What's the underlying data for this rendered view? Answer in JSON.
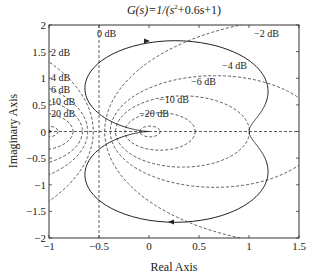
{
  "chart_data": {
    "type": "line",
    "title_parts": {
      "pre": "G(s)=1/(s",
      "sup": "2",
      "post": "+0.6s+1)"
    },
    "xlabel": "Real Axis",
    "ylabel": "Imaginary Axis",
    "xlim": [
      -1,
      1.5
    ],
    "ylim": [
      -2,
      2
    ],
    "xticks": [
      -1,
      -0.5,
      0,
      0.5,
      1,
      1.5
    ],
    "xtick_labels": [
      "−1",
      "−0.5",
      "0",
      "0.5",
      "1",
      "1.5"
    ],
    "yticks": [
      -2,
      -1.5,
      -1,
      -0.5,
      0,
      0.5,
      1,
      1.5,
      2
    ],
    "ytick_labels": [
      "−2",
      "−1.5",
      "−1",
      "−0.5",
      "0",
      "0.5",
      "1",
      "1.5",
      "2"
    ],
    "grid": "M-circles",
    "transfer_function": {
      "num": [
        1
      ],
      "den": [
        1,
        0.6,
        1
      ]
    },
    "series": [
      {
        "name": "Nyquist plot",
        "style": "solid",
        "description": "closed contour from (1,0) through (0,-1.667) back to origin and mirrored positive-frequency branch"
      }
    ],
    "m_circles": [
      {
        "label": "0 dB",
        "db": 0,
        "label_pos": [
          -0.52,
          1.78
        ]
      },
      {
        "label": "2 dB",
        "db": 2,
        "label_pos": [
          -0.98,
          1.42
        ]
      },
      {
        "label": "−2 dB",
        "db": -2,
        "label_pos": [
          1.05,
          1.78
        ]
      },
      {
        "label": "4 dB",
        "db": 4,
        "label_pos": [
          -0.98,
          0.95
        ]
      },
      {
        "label": "−4 dB",
        "db": -4,
        "label_pos": [
          0.73,
          1.18
        ]
      },
      {
        "label": "6 dB",
        "db": 6,
        "label_pos": [
          -0.98,
          0.72
        ]
      },
      {
        "label": "−6 dB",
        "db": -6,
        "label_pos": [
          0.42,
          0.87
        ]
      },
      {
        "label": "10 dB",
        "db": 10,
        "label_pos": [
          -0.98,
          0.5
        ]
      },
      {
        "label": "−10 dB",
        "db": -10,
        "label_pos": [
          0.1,
          0.53
        ]
      },
      {
        "label": "20 dB",
        "db": 20,
        "label_pos": [
          -0.98,
          0.28
        ]
      },
      {
        "label": "−20 dB",
        "db": -20,
        "label_pos": [
          -0.1,
          0.28
        ]
      }
    ]
  }
}
